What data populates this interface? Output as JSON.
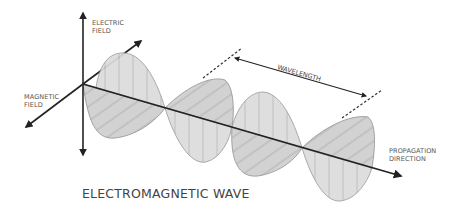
{
  "diagram": {
    "title": "ELECTROMAGNETIC WAVE",
    "labels": {
      "electric_field": [
        "ELECTRIC",
        "FIELD"
      ],
      "magnetic_field": [
        "MAGNETIC",
        "FIELD"
      ],
      "propagation_direction": [
        "PROPAGATION",
        "DIRECTION"
      ],
      "wavelength": "WAVELENGTH"
    },
    "colors": {
      "fill": "#d9d9d9",
      "outline": "#9a9a9a",
      "hatch": "#a8a8a8",
      "axis": "#222222",
      "text": "#555555"
    }
  }
}
